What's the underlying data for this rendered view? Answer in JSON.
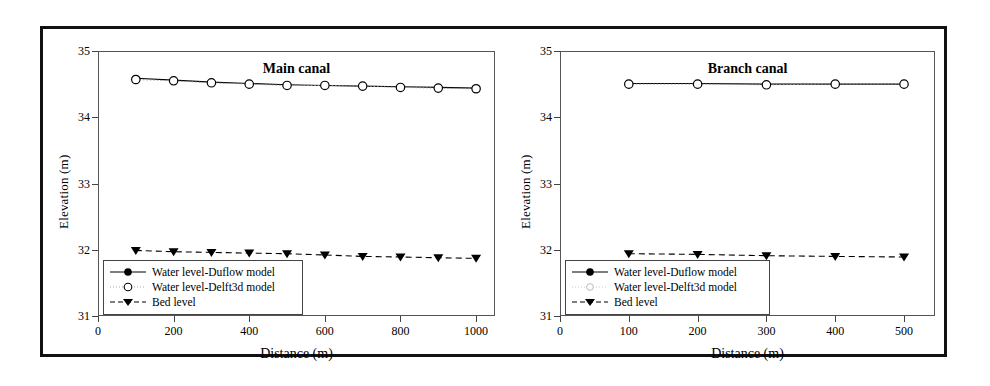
{
  "figure": {
    "border_color": "#111111"
  },
  "legend_labels": {
    "duflow": "Water level-Duflow model",
    "delft3d": "Water level-Delft3d model",
    "bed": "Bed level"
  },
  "chart_data": [
    {
      "type": "line",
      "title": "Main canal",
      "xlabel": "Distance (m)",
      "ylabel": "Elevation (m)",
      "xlim": [
        0,
        1050
      ],
      "ylim": [
        31,
        35
      ],
      "xticks": [
        0,
        200,
        400,
        600,
        800,
        1000
      ],
      "yticks": [
        31,
        32,
        33,
        34,
        35
      ],
      "grid": false,
      "legend_position": "lower-left",
      "x": [
        100,
        200,
        300,
        400,
        500,
        600,
        700,
        800,
        900,
        1000
      ],
      "series": [
        {
          "name": "Water level-Duflow model",
          "marker": "filled-circle",
          "linestyle": "solid",
          "values": [
            34.59,
            34.56,
            34.53,
            34.51,
            34.49,
            34.48,
            34.47,
            34.46,
            34.45,
            34.44
          ]
        },
        {
          "name": "Water level-Delft3d model",
          "marker": "open-circle",
          "linestyle": "dotted",
          "values": [
            34.57,
            34.55,
            34.52,
            34.5,
            34.48,
            34.48,
            34.47,
            34.45,
            34.44,
            34.43
          ]
        },
        {
          "name": "Bed level",
          "marker": "filled-triangle-down",
          "linestyle": "dashed",
          "values": [
            31.99,
            31.97,
            31.96,
            31.95,
            31.94,
            31.92,
            31.9,
            31.89,
            31.88,
            31.87
          ]
        }
      ]
    },
    {
      "type": "line",
      "title": "Branch canal",
      "xlabel": "Distance (m)",
      "ylabel": "Elevation (m)",
      "xlim": [
        0,
        545
      ],
      "ylim": [
        31,
        35
      ],
      "xticks": [
        0,
        100,
        200,
        300,
        400,
        500
      ],
      "yticks": [
        31,
        32,
        33,
        34,
        35
      ],
      "grid": false,
      "legend_position": "lower-left",
      "x": [
        100,
        200,
        300,
        400,
        500
      ],
      "series": [
        {
          "name": "Water level-Duflow model",
          "marker": "filled-circle",
          "linestyle": "solid",
          "values": [
            34.51,
            34.51,
            34.5,
            34.5,
            34.5
          ]
        },
        {
          "name": "Water level-Delft3d model",
          "marker": "open-circle",
          "linestyle": "dotted",
          "values": [
            34.5,
            34.5,
            34.49,
            34.5,
            34.5
          ]
        },
        {
          "name": "Bed level",
          "marker": "filled-triangle-down",
          "linestyle": "dashed",
          "values": [
            31.94,
            31.93,
            31.91,
            31.9,
            31.89
          ]
        }
      ]
    }
  ]
}
